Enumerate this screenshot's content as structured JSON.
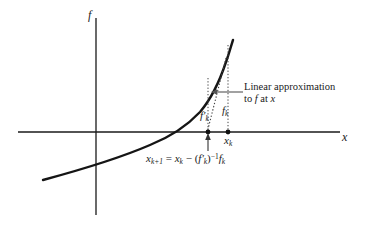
{
  "figure": {
    "type": "newton-method-diagram",
    "background_color": "#ffffff",
    "line_color": "#1a1a1a",
    "axes": {
      "vertical_label": "f",
      "horizontal_label": "x",
      "origin_px": [
        96,
        132
      ],
      "vertical_span_px": [
        18,
        215
      ],
      "horizontal_span_px": [
        18,
        340
      ]
    },
    "labels": {
      "f_k": {
        "base": "f",
        "sub": "k"
      },
      "f_prime_k": {
        "base": "f",
        "prime": "′",
        "sub": "k"
      },
      "x_k": {
        "base": "x",
        "sub": "k"
      }
    },
    "annotation": {
      "line1": "Linear approximation",
      "line2_pre": "to ",
      "line2_f": "f",
      "line2_mid": " at ",
      "line2_x": "x",
      "arrow": "leftward-arrow-to-tangent-line",
      "arrow_from_px": [
        243,
        92
      ],
      "arrow_to_px": [
        212,
        92
      ]
    },
    "equation": {
      "lhs_base": "x",
      "lhs_sub": "k+1",
      "eq": " = ",
      "t1_base": "x",
      "t1_sub": "k",
      "minus": " − ",
      "open": "(",
      "t2_base": "f",
      "t2_prime": "′",
      "t2_sub": "k",
      "close": ")",
      "exp": "−1",
      "t3_base": "f",
      "t3_sub": "k",
      "arrow": "upward-arrow-to-x-k-plus-1",
      "arrow_from_px": [
        208,
        150
      ],
      "arrow_to_px": [
        208,
        134
      ]
    },
    "points": [
      {
        "name": "x-k-plus-1-point",
        "px": [
          208,
          132
        ]
      },
      {
        "name": "x-k-point",
        "px": [
          228,
          132
        ]
      },
      {
        "name": "curve-point-at-x-k",
        "px": [
          224,
          62
        ]
      }
    ],
    "curve": {
      "name": "function-curve",
      "description": "increasing convex exponential-like curve crossing x-axis near x=178px",
      "root_px": [
        178,
        132
      ],
      "start_px": [
        43,
        180
      ],
      "end_px": [
        233,
        40
      ],
      "stroke_width": 2.4
    },
    "tangent_line": {
      "name": "tangent-line",
      "style": "dotted",
      "from_px": [
        224,
        62
      ],
      "to_px": [
        208,
        132
      ]
    },
    "drop_lines": [
      {
        "name": "drop-line-x-k",
        "style": "dotted",
        "from_px": [
          228,
          45
        ],
        "to_px": [
          228,
          132
        ]
      },
      {
        "name": "drop-line-x-k-plus-1",
        "style": "dotted",
        "from_px": [
          208,
          78
        ],
        "to_px": [
          208,
          132
        ]
      }
    ]
  }
}
